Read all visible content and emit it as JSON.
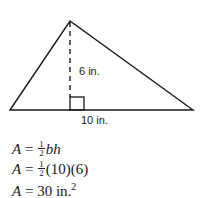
{
  "diagram": {
    "shape": "triangle",
    "vertices": {
      "left": [
        10,
        110
      ],
      "apex": [
        70,
        21
      ],
      "right": [
        193,
        110
      ]
    },
    "height_label": "6 in.",
    "base_label": "10 in.",
    "line_color": "#1a1a1a"
  },
  "equations": {
    "line1": {
      "lhs": "A",
      "eq": "=",
      "frac_num": "1",
      "frac_den": "2",
      "rest": "bh"
    },
    "line2": {
      "lhs": "A",
      "eq": "=",
      "frac_num": "1",
      "frac_den": "2",
      "rest": "(10)(6)"
    },
    "line3": {
      "lhs": "A",
      "eq": "=",
      "value": "30 in.",
      "exponent": "2"
    }
  }
}
